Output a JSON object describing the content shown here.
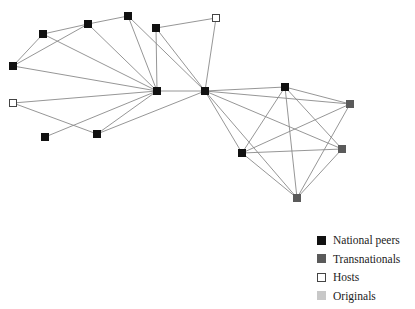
{
  "chart_data": {
    "type": "network",
    "title": "",
    "node_types": {
      "national": {
        "label": "National peers",
        "fill": "#111111",
        "stroke": "#111111"
      },
      "transnational": {
        "label": "Transnationals",
        "fill": "#5a5a5a",
        "stroke": "#5a5a5a"
      },
      "host": {
        "label": "Hosts",
        "fill": "#ffffff",
        "stroke": "#444444"
      },
      "original": {
        "label": "Originals",
        "fill": "#c8c8c8",
        "stroke": "#c8c8c8"
      }
    },
    "nodes": [
      {
        "id": "A",
        "x": 43,
        "y": 34,
        "type": "national"
      },
      {
        "id": "B",
        "x": 88,
        "y": 24,
        "type": "national"
      },
      {
        "id": "C",
        "x": 128,
        "y": 16,
        "type": "national"
      },
      {
        "id": "D",
        "x": 156,
        "y": 28,
        "type": "national"
      },
      {
        "id": "E",
        "x": 216,
        "y": 18,
        "type": "host"
      },
      {
        "id": "F",
        "x": 13,
        "y": 66,
        "type": "national"
      },
      {
        "id": "G",
        "x": 157,
        "y": 91,
        "type": "national"
      },
      {
        "id": "H",
        "x": 205,
        "y": 91,
        "type": "national"
      },
      {
        "id": "I",
        "x": 13,
        "y": 103,
        "type": "host"
      },
      {
        "id": "J",
        "x": 45,
        "y": 137,
        "type": "national"
      },
      {
        "id": "K",
        "x": 97,
        "y": 134,
        "type": "national"
      },
      {
        "id": "L",
        "x": 285,
        "y": 87,
        "type": "national"
      },
      {
        "id": "M",
        "x": 350,
        "y": 104,
        "type": "transnational"
      },
      {
        "id": "N",
        "x": 242,
        "y": 153,
        "type": "national"
      },
      {
        "id": "O",
        "x": 342,
        "y": 149,
        "type": "transnational"
      },
      {
        "id": "P",
        "x": 297,
        "y": 198,
        "type": "transnational"
      }
    ],
    "edges": [
      [
        "A",
        "B"
      ],
      [
        "A",
        "F"
      ],
      [
        "A",
        "G"
      ],
      [
        "B",
        "C"
      ],
      [
        "B",
        "F"
      ],
      [
        "B",
        "G"
      ],
      [
        "C",
        "G"
      ],
      [
        "C",
        "H"
      ],
      [
        "D",
        "E"
      ],
      [
        "D",
        "G"
      ],
      [
        "D",
        "H"
      ],
      [
        "E",
        "H"
      ],
      [
        "F",
        "G"
      ],
      [
        "G",
        "H"
      ],
      [
        "G",
        "I"
      ],
      [
        "G",
        "J"
      ],
      [
        "G",
        "K"
      ],
      [
        "I",
        "K"
      ],
      [
        "K",
        "H"
      ],
      [
        "H",
        "L"
      ],
      [
        "H",
        "M"
      ],
      [
        "H",
        "N"
      ],
      [
        "H",
        "O"
      ],
      [
        "H",
        "P"
      ],
      [
        "L",
        "M"
      ],
      [
        "L",
        "N"
      ],
      [
        "L",
        "O"
      ],
      [
        "L",
        "P"
      ],
      [
        "N",
        "M"
      ],
      [
        "N",
        "O"
      ],
      [
        "N",
        "P"
      ],
      [
        "M",
        "P"
      ],
      [
        "O",
        "P"
      ]
    ],
    "edge_color": "#8a8a8a",
    "legend": [
      {
        "key": "national",
        "label": "National peers"
      },
      {
        "key": "transnational",
        "label": "Transnationals"
      },
      {
        "key": "host",
        "label": "Hosts"
      },
      {
        "key": "original",
        "label": "Originals"
      }
    ],
    "legend_position": "bottom-right"
  },
  "legend": {
    "national": "National peers",
    "transnational": "Transnationals",
    "host": "Hosts",
    "original": "Originals"
  }
}
